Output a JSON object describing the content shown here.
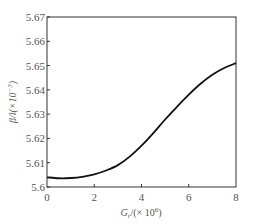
{
  "chart_data": {
    "type": "line",
    "title": "",
    "xlabel": "G_r/(×10^6)",
    "ylabel": "β/l(×10^-3)",
    "xlim": [
      0,
      8
    ],
    "ylim": [
      5.6,
      5.67
    ],
    "x_ticks": [
      "0",
      "2",
      "4",
      "6",
      "8"
    ],
    "y_ticks": [
      "5.6",
      "5.61",
      "5.62",
      "5.63",
      "5.64",
      "5.65",
      "5.66",
      "5.67"
    ],
    "grid": false,
    "legend": null,
    "series": [
      {
        "name": "β/l",
        "x": [
          0,
          0.5,
          1,
          1.5,
          2,
          2.5,
          3,
          3.5,
          4,
          4.5,
          5,
          5.5,
          6,
          6.5,
          7,
          7.5,
          8
        ],
        "values": [
          5.604,
          5.6036,
          5.6037,
          5.6042,
          5.6052,
          5.6068,
          5.609,
          5.6125,
          5.617,
          5.6222,
          5.6278,
          5.633,
          5.638,
          5.6425,
          5.6462,
          5.649,
          5.651
        ]
      }
    ]
  },
  "labels": {
    "x_axis_main": "G",
    "x_axis_sub": "r",
    "x_axis_rest": "/(× 10",
    "x_axis_exp": "6",
    "x_axis_close": ")",
    "y_axis_main": "β/l(×10",
    "y_axis_exp": "−3",
    "y_axis_close": ")"
  }
}
